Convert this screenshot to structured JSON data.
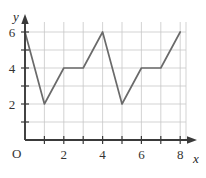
{
  "chart_data": {
    "type": "line",
    "title": "",
    "xlabel": "x",
    "ylabel": "y",
    "origin_label": "O",
    "x": [
      0,
      1,
      2,
      3,
      4,
      5,
      6,
      7,
      8
    ],
    "values": [
      6,
      2,
      4,
      4,
      6,
      2,
      4,
      4,
      6
    ],
    "series": [
      {
        "name": "",
        "values": [
          6,
          2,
          4,
          4,
          6,
          2,
          4,
          4,
          6
        ]
      }
    ],
    "points": [
      {
        "x": 0,
        "y": 6
      },
      {
        "x": 1,
        "y": 2
      },
      {
        "x": 2,
        "y": 4
      },
      {
        "x": 3,
        "y": 4
      },
      {
        "x": 4,
        "y": 6
      },
      {
        "x": 5,
        "y": 2
      },
      {
        "x": 6,
        "y": 4
      },
      {
        "x": 7,
        "y": 4
      },
      {
        "x": 8,
        "y": 6
      }
    ],
    "xlim": [
      0,
      8.35
    ],
    "ylim": [
      0,
      6.6
    ],
    "xticks": [
      0,
      1,
      2,
      3,
      4,
      5,
      6,
      7,
      8
    ],
    "xtick_labels": [
      "",
      "",
      "2",
      "",
      "4",
      "",
      "6",
      "",
      "8"
    ],
    "yticks": [
      1,
      2,
      3,
      4,
      5,
      6
    ],
    "ytick_labels": [
      "",
      "2",
      "",
      "4",
      "",
      "6"
    ],
    "grid": true,
    "legend": "none",
    "line_color": "#6a6a6a",
    "grid_color": "#c8c8c8",
    "axis_color": "#3a3a3a"
  },
  "axes": {
    "y_axis_name": "y",
    "x_axis_name": "x",
    "origin": "O"
  },
  "tick_labels": {
    "x": [
      {
        "value": "2"
      },
      {
        "value": "4"
      },
      {
        "value": "6"
      },
      {
        "value": "8"
      }
    ],
    "y": [
      {
        "value": "2"
      },
      {
        "value": "4"
      },
      {
        "value": "6"
      }
    ]
  }
}
